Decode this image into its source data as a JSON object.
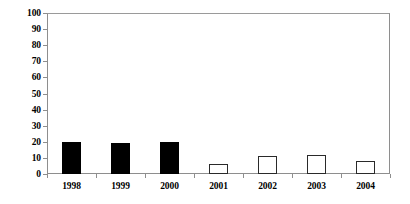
{
  "chart_data": {
    "type": "bar",
    "title": "",
    "xlabel": "",
    "ylabel": "",
    "categories": [
      "1998",
      "1999",
      "2000",
      "2001",
      "2002",
      "2003",
      "2004"
    ],
    "values": [
      20,
      19,
      20,
      6,
      11,
      12,
      8
    ],
    "bar_styles": [
      "filled",
      "filled",
      "filled",
      "hollow",
      "hollow",
      "hollow",
      "hollow"
    ],
    "ylim": [
      0,
      100
    ],
    "ytick_step": 10,
    "ytick_labels": [
      "100",
      "90",
      "80",
      "70",
      "60",
      "50",
      "40",
      "30",
      "20",
      "10",
      "0"
    ],
    "ytick_values": [
      100,
      90,
      80,
      70,
      60,
      50,
      40,
      30,
      20,
      10,
      0
    ],
    "grid": false,
    "legend": null,
    "colors": {
      "bar_filled": "#000000",
      "bar_hollow_fill": "#ffffff",
      "bar_hollow_stroke": "#2a2a2a",
      "axis": "#8e8e8e",
      "text": "#000000",
      "background": "#ffffff"
    }
  }
}
